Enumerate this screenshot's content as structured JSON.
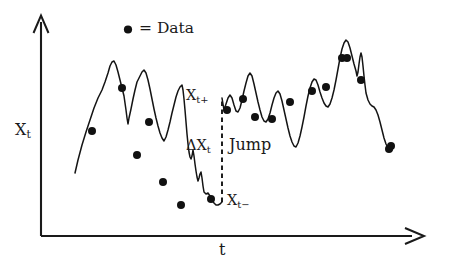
{
  "figure": {
    "legend": {
      "marker_icon": "filled-circle-marker",
      "text": "= Data"
    },
    "axes": {
      "y_label": "X",
      "y_label_sub": "t",
      "x_label": "t",
      "y_arrow_icon": "arrow-up-open",
      "x_arrow_icon": "arrow-right-open"
    },
    "annotations": {
      "xt_plus": "X",
      "xt_plus_sub": "t+",
      "xt_minus": "X",
      "xt_minus_sub": "t−",
      "delta_xt": "ΔX",
      "delta_xt_sub": "t",
      "jump": "Jump"
    }
  },
  "chart_data": {
    "type": "line",
    "title": "",
    "xlabel": "t",
    "ylabel": "X_t",
    "grid": false,
    "legend_position": "top-center",
    "legend_entries": [
      "= Data"
    ],
    "annotations": [
      "X_t+",
      "X_t−",
      "ΔX_t",
      "Jump"
    ],
    "axis_origin_px": [
      41,
      236
    ],
    "xlim_px": [
      41,
      425
    ],
    "ylim_px": [
      236,
      18
    ],
    "jump_time_px": 222,
    "jump_from_px": 202,
    "jump_to_px": 98,
    "series": [
      {
        "name": "segment-before-jump",
        "points_px": [
          [
            75,
            173
          ],
          [
            78,
            160
          ],
          [
            82,
            145
          ],
          [
            86,
            132
          ],
          [
            90,
            120
          ],
          [
            94,
            108
          ],
          [
            98,
            98
          ],
          [
            102,
            90
          ],
          [
            105,
            82
          ],
          [
            108,
            73
          ],
          [
            110,
            66
          ],
          [
            112,
            62
          ],
          [
            114,
            61
          ],
          [
            116,
            65
          ],
          [
            118,
            72
          ],
          [
            120,
            80
          ],
          [
            122,
            88
          ],
          [
            124,
            96
          ],
          [
            125,
            103
          ],
          [
            126,
            110
          ],
          [
            127,
            118
          ],
          [
            128,
            124
          ],
          [
            129,
            118
          ],
          [
            131,
            109
          ],
          [
            133,
            99
          ],
          [
            135,
            90
          ],
          [
            137,
            82
          ],
          [
            140,
            76
          ],
          [
            142,
            72
          ],
          [
            144,
            70
          ],
          [
            146,
            73
          ],
          [
            148,
            80
          ],
          [
            150,
            89
          ],
          [
            152,
            99
          ],
          [
            154,
            109
          ],
          [
            156,
            118
          ],
          [
            158,
            126
          ],
          [
            160,
            133
          ],
          [
            162,
            138
          ],
          [
            164,
            141
          ],
          [
            166,
            137
          ],
          [
            168,
            130
          ],
          [
            170,
            122
          ],
          [
            172,
            113
          ],
          [
            174,
            105
          ],
          [
            176,
            97
          ],
          [
            178,
            91
          ],
          [
            180,
            87
          ],
          [
            182,
            85
          ],
          [
            183,
            90
          ],
          [
            184,
            99
          ],
          [
            185,
            110
          ],
          [
            186,
            122
          ],
          [
            187,
            134
          ],
          [
            188,
            144
          ],
          [
            189,
            152
          ],
          [
            190,
            157
          ],
          [
            191,
            159
          ],
          [
            192,
            156
          ],
          [
            193,
            150
          ],
          [
            194,
            156
          ],
          [
            195,
            164
          ],
          [
            196,
            171
          ],
          [
            197,
            177
          ],
          [
            198,
            181
          ],
          [
            199,
            178
          ],
          [
            200,
            174
          ],
          [
            201,
            172
          ],
          [
            202,
            178
          ],
          [
            203,
            186
          ],
          [
            204,
            192
          ],
          [
            206,
            194
          ],
          [
            208,
            193
          ],
          [
            210,
            196
          ],
          [
            212,
            200
          ],
          [
            214,
            203
          ],
          [
            216,
            205
          ],
          [
            218,
            205
          ],
          [
            220,
            204
          ],
          [
            222,
            202
          ]
        ]
      },
      {
        "name": "segment-after-jump",
        "points_px": [
          [
            222,
            98
          ],
          [
            223,
            104
          ],
          [
            224,
            110
          ],
          [
            226,
            104
          ],
          [
            228,
            98
          ],
          [
            230,
            95
          ],
          [
            232,
            98
          ],
          [
            234,
            105
          ],
          [
            236,
            111
          ],
          [
            238,
            112
          ],
          [
            240,
            108
          ],
          [
            242,
            100
          ],
          [
            244,
            91
          ],
          [
            246,
            83
          ],
          [
            248,
            76
          ],
          [
            250,
            73
          ],
          [
            252,
            76
          ],
          [
            254,
            84
          ],
          [
            256,
            93
          ],
          [
            258,
            102
          ],
          [
            260,
            110
          ],
          [
            262,
            117
          ],
          [
            264,
            121
          ],
          [
            266,
            122
          ],
          [
            268,
            119
          ],
          [
            270,
            113
          ],
          [
            272,
            105
          ],
          [
            274,
            98
          ],
          [
            276,
            93
          ],
          [
            278,
            91
          ],
          [
            280,
            94
          ],
          [
            282,
            101
          ],
          [
            284,
            110
          ],
          [
            286,
            119
          ],
          [
            288,
            128
          ],
          [
            290,
            136
          ],
          [
            292,
            142
          ],
          [
            294,
            146
          ],
          [
            296,
            147
          ],
          [
            298,
            143
          ],
          [
            300,
            136
          ],
          [
            302,
            127
          ],
          [
            304,
            117
          ],
          [
            306,
            106
          ],
          [
            308,
            96
          ],
          [
            310,
            88
          ],
          [
            312,
            82
          ],
          [
            314,
            79
          ],
          [
            316,
            80
          ],
          [
            318,
            85
          ],
          [
            320,
            92
          ],
          [
            322,
            98
          ],
          [
            324,
            103
          ],
          [
            326,
            106
          ],
          [
            328,
            107
          ],
          [
            330,
            104
          ],
          [
            332,
            98
          ],
          [
            334,
            90
          ],
          [
            336,
            80
          ],
          [
            338,
            69
          ],
          [
            340,
            58
          ],
          [
            342,
            49
          ],
          [
            344,
            43
          ],
          [
            346,
            40
          ],
          [
            348,
            42
          ],
          [
            350,
            48
          ],
          [
            352,
            56
          ],
          [
            354,
            64
          ],
          [
            356,
            71
          ],
          [
            357,
            76
          ],
          [
            358,
            72
          ],
          [
            359,
            64
          ],
          [
            360,
            57
          ],
          [
            361,
            53
          ],
          [
            362,
            57
          ],
          [
            363,
            66
          ],
          [
            364,
            76
          ],
          [
            365,
            85
          ],
          [
            366,
            93
          ],
          [
            368,
            100
          ],
          [
            370,
            104
          ],
          [
            372,
            106
          ],
          [
            374,
            107
          ],
          [
            376,
            110
          ],
          [
            378,
            115
          ],
          [
            380,
            122
          ],
          [
            382,
            130
          ],
          [
            384,
            138
          ],
          [
            386,
            144
          ],
          [
            388,
            148
          ],
          [
            390,
            150
          ],
          [
            392,
            150
          ]
        ]
      }
    ],
    "data_points_px": [
      [
        92,
        131
      ],
      [
        122,
        88
      ],
      [
        137,
        155
      ],
      [
        149,
        122
      ],
      [
        163,
        182
      ],
      [
        181,
        205
      ],
      [
        211,
        199
      ],
      [
        227,
        110
      ],
      [
        243,
        99
      ],
      [
        255,
        117
      ],
      [
        272,
        119
      ],
      [
        290,
        102
      ],
      [
        312,
        91
      ],
      [
        326,
        87
      ],
      [
        342,
        58
      ],
      [
        347,
        58
      ],
      [
        361,
        80
      ],
      [
        389,
        149
      ],
      [
        391,
        146
      ]
    ]
  }
}
